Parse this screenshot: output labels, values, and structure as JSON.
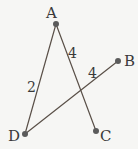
{
  "diagram": {
    "background": "#f6f6f4",
    "line_color": "#5a5048",
    "point_color": "#5b5b5b",
    "text_color": "#3a3a3a",
    "points": {
      "A": {
        "label": "A",
        "x": 56,
        "y": 24,
        "label_x": 46,
        "label_y": 18
      },
      "B": {
        "label": "B",
        "x": 118,
        "y": 61,
        "label_x": 124,
        "label_y": 61
      },
      "C": {
        "label": "C",
        "x": 96,
        "y": 131,
        "label_x": 100,
        "label_y": 141
      },
      "D": {
        "label": "D",
        "x": 25,
        "y": 134,
        "label_x": 9,
        "label_y": 141
      }
    },
    "segments": [
      {
        "from": "A",
        "to": "D"
      },
      {
        "from": "A",
        "to": "C"
      },
      {
        "from": "D",
        "to": "B"
      }
    ],
    "length_labels": [
      {
        "text": "2",
        "segment": "AD",
        "x": 27,
        "y": 93
      },
      {
        "text": "4",
        "segment": "AC",
        "x": 69,
        "y": 58
      },
      {
        "text": "4",
        "segment": "DB",
        "x": 88,
        "y": 78
      }
    ]
  }
}
